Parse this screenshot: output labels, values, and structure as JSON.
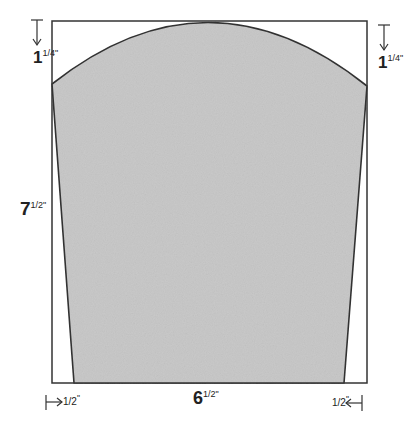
{
  "diagram": {
    "type": "pattern-template",
    "colors": {
      "fill": "#c8c8c8",
      "stroke": "#333333",
      "background": "#ffffff"
    },
    "dimensions": {
      "top_left_drop": {
        "whole": "1",
        "frac": "1/4",
        "unit": "\""
      },
      "top_right_drop": {
        "whole": "1",
        "frac": "1/4",
        "unit": "\""
      },
      "height": {
        "whole": "7",
        "frac": "1/2",
        "unit": "\""
      },
      "width": {
        "whole": "6",
        "frac": "1/2",
        "unit": "\""
      },
      "bottom_left_inset": {
        "frac": "1/2",
        "unit": "\""
      },
      "bottom_right_inset": {
        "frac": "1/2",
        "unit": "\""
      }
    }
  }
}
